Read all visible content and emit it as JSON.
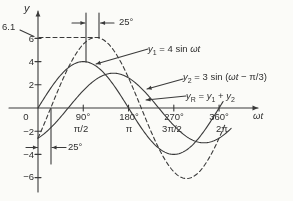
{
  "chart_data": {
    "type": "line",
    "x_axis": {
      "label": "ωt",
      "ticks_deg": [
        90,
        180,
        270,
        360
      ],
      "tick_labels_deg": [
        "90°",
        "180°",
        "270°",
        "360°"
      ],
      "tick_labels_rad": [
        "π/2",
        "π",
        "3π/2",
        "2π"
      ],
      "range_deg": [
        0,
        388
      ]
    },
    "y_axis": {
      "label": "y",
      "origin_label": "0",
      "tick_values": [
        6,
        4,
        2,
        -2,
        -4,
        -6
      ],
      "tick_labels": [
        "6",
        "4",
        "2",
        "−2",
        "−4",
        "−6"
      ],
      "range": [
        -6.5,
        6.5
      ]
    },
    "series": [
      {
        "name": "y1",
        "amplitude": 4,
        "phase_deg": 0,
        "style": "solid",
        "plot_end_deg": 368
      },
      {
        "name": "y2",
        "amplitude": 3,
        "phase_deg": -60,
        "style": "solid",
        "plot_end_deg": 385
      },
      {
        "name": "yR",
        "amplitude": 6.08,
        "phase_deg": -25.3,
        "style": "dashed",
        "plot_end_deg": 372
      }
    ],
    "annotations": {
      "peak_value": "6.1",
      "peak_shift_label": "25°",
      "zero_shift_label": "25°"
    },
    "equations": {
      "y1": {
        "base": "y",
        "sub": "1",
        "mid": " = 4 sin ",
        "ital": "ωt",
        "tail": ""
      },
      "y2": {
        "base": "y",
        "sub": "2",
        "mid": " = 3 sin (",
        "ital": "ωt",
        "tail": " − π/3)"
      },
      "yr": {
        "base": "y",
        "sub": "R",
        "mid": " = ",
        "b1": "y",
        "s1": "1",
        "mid2": " + ",
        "b2": "y",
        "s2": "2"
      }
    }
  }
}
